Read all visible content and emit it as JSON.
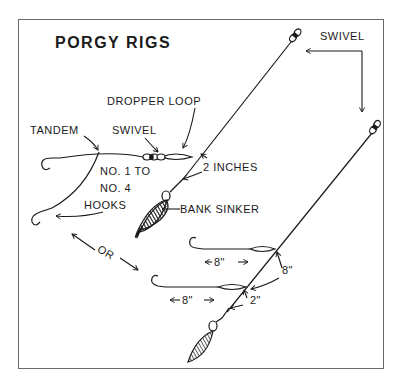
{
  "diagram": {
    "title": "PORGY RIGS",
    "colors": {
      "ink": "#1a1a1a",
      "frame": "#6a6a6a",
      "background": "#ffffff"
    },
    "labels": {
      "swivel_top": "SWIVEL",
      "dropper_loop": "DROPPER LOOP",
      "tandem": "TANDEM",
      "swivel_left": "SWIVEL",
      "hooks_line1": "NO. 1 TO",
      "hooks_line2": "NO. 4",
      "hooks_line3": "HOOKS",
      "two_inches": "2 INCHES",
      "bank_sinker": "BANK SINKER",
      "or": "OR",
      "upper_dropper_length": "8\"",
      "lower_dropper_length": "8\"",
      "spacing_between": "8\"",
      "spacing_to_sinker": "2\""
    },
    "rigs": [
      {
        "name": "tandem-hook-rig",
        "parts": [
          "swivel",
          "dropper loop",
          "tandem hooks",
          "bank sinker"
        ]
      },
      {
        "name": "two-dropper-rig",
        "parts": [
          "swivel",
          "two 8-inch droppers",
          "bank sinker"
        ]
      }
    ]
  }
}
